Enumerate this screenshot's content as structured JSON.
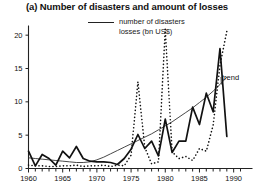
{
  "chart_data": {
    "type": "line",
    "title": "(a) Number of disasters and amount of losses",
    "xlabel": "",
    "ylabel": "",
    "xlim": [
      1960,
      1991
    ],
    "ylim": [
      0,
      21
    ],
    "yticks": [
      0,
      5,
      10,
      15,
      20
    ],
    "xticks": [
      1960,
      1965,
      1970,
      1975,
      1980,
      1985,
      1990
    ],
    "xtick_minor_step": 1,
    "grid": false,
    "legend_position": "top-center",
    "legend": [
      {
        "label": "number of disasters",
        "style": "solid"
      },
      {
        "label": "losses (bn US$)",
        "style": "dotted"
      }
    ],
    "annotations": [
      {
        "text": "trend",
        "x": 1989,
        "y": 13.5,
        "leader": true
      }
    ],
    "x": [
      1960,
      1961,
      1962,
      1963,
      1964,
      1965,
      1966,
      1967,
      1968,
      1969,
      1970,
      1971,
      1972,
      1973,
      1974,
      1975,
      1976,
      1977,
      1978,
      1979,
      1980,
      1981,
      1982,
      1983,
      1984,
      1985,
      1986,
      1987,
      1988,
      1989
    ],
    "series": [
      {
        "name": "number of disasters",
        "style": "solid",
        "values": [
          2.6,
          0.4,
          2.1,
          1.5,
          0.5,
          2.6,
          1.6,
          3.3,
          1.5,
          1.1,
          1.0,
          1.0,
          0.9,
          0.6,
          1.5,
          2.9,
          5.1,
          3.0,
          4.1,
          1.9,
          7.4,
          2.4,
          4.1,
          4.1,
          9.2,
          6.6,
          11.3,
          8.5,
          18.0,
          4.8
        ]
      },
      {
        "name": "losses (bn US$)",
        "style": "dotted",
        "values": [
          0.5,
          0.4,
          0.4,
          0.3,
          0.3,
          0.4,
          0.4,
          0.5,
          0.3,
          0.4,
          0.4,
          0.5,
          0.3,
          0.5,
          0.4,
          2.0,
          13.0,
          3.2,
          0.7,
          1.0,
          20.9,
          2.5,
          1.5,
          1.8,
          1.2,
          3.0,
          2.6,
          6.5,
          15.5,
          20.6
        ]
      },
      {
        "name": "trend",
        "style": "thin-solid",
        "values": [
          1.6,
          1.5,
          1.4,
          1.3,
          1.2,
          1.1,
          1.0,
          0.9,
          0.9,
          1.0,
          1.3,
          1.7,
          2.2,
          2.7,
          3.2,
          3.7,
          4.2,
          4.7,
          5.2,
          5.8,
          6.4,
          7.0,
          7.7,
          8.4,
          9.1,
          9.9,
          10.7,
          11.6,
          12.6,
          13.7
        ]
      }
    ]
  },
  "ytick_labels": [
    "0",
    "5",
    "10",
    "15",
    "20"
  ],
  "xtick_labels": [
    "1960",
    "1965",
    "1970",
    "1975",
    "1980",
    "1985",
    "1990"
  ],
  "trend_annotation": "trend"
}
